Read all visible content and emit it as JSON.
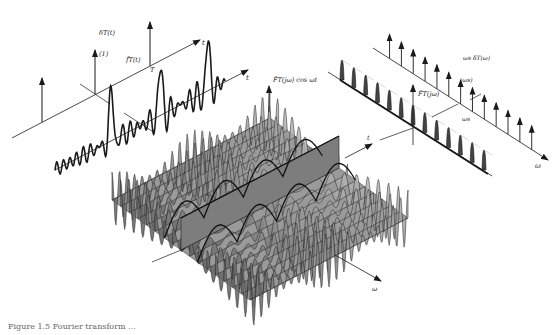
{
  "figure": {
    "caption_fragment": "Figure 1.5   Fourier transform ...",
    "left_panel": {
      "impulse_train_label": "δT(t)",
      "impulse_weight_label": "(1)",
      "signal_label": "f̃T(t)",
      "period_label": "T",
      "axis_label_upper": "t",
      "axis_label_lower": "t"
    },
    "center_panel": {
      "surface_label": "F̃T(jω) cos ωt",
      "axis_t_label": "t",
      "axis_omega_label": "ω"
    },
    "right_panel": {
      "impulse_train_label": "ωs δT(ω)",
      "impulse_weight_label": "(ωs)",
      "spacing_label": "ωs",
      "spectrum_label": "F̃T(jω)",
      "axis_label_upper": "ω",
      "axis_label_lower": "ω"
    },
    "colors": {
      "ink": "#1a1a1a",
      "surface_fill": "#8c8c8c",
      "surface_dark": "#555555",
      "background": "#ffffff"
    }
  }
}
